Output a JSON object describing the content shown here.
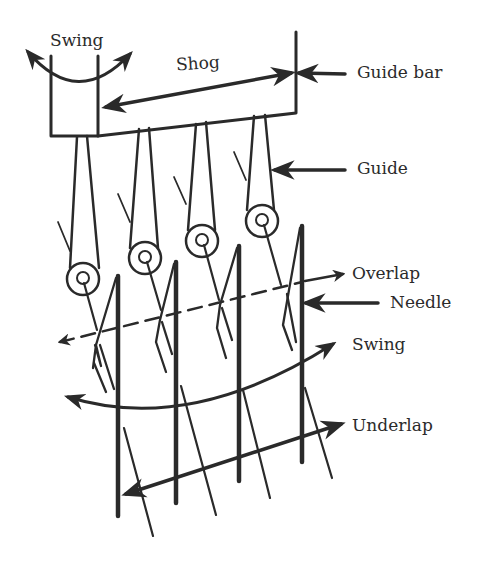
{
  "diagram": {
    "stroke_color": "#2a2a2a",
    "background": "#ffffff",
    "labels": {
      "swing_top": "Swing",
      "shog": "Shog",
      "guide_bar": "Guide bar",
      "guide": "Guide",
      "overlap": "Overlap",
      "needle": "Needle",
      "swing_bottom": "Swing",
      "underlap": "Underlap"
    },
    "components": {
      "guide_count": 4,
      "needle_count": 4
    }
  }
}
